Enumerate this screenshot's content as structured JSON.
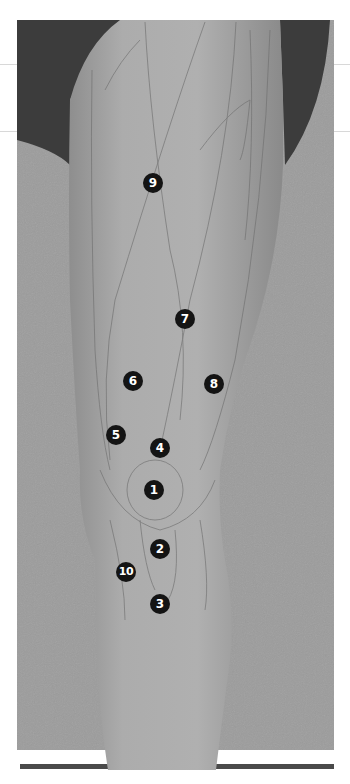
{
  "figure": {
    "type": "anatomical-illustration",
    "colors": {
      "background_frame": "#9a9a9a",
      "shadow": "#3a3a3a",
      "skin": "#a8a8a8",
      "marker": "#141414",
      "marker_text": "#ffffff"
    }
  },
  "points": [
    {
      "label": "1",
      "x": 154,
      "y": 490
    },
    {
      "label": "2",
      "x": 160,
      "y": 549
    },
    {
      "label": "3",
      "x": 160,
      "y": 604
    },
    {
      "label": "4",
      "x": 160,
      "y": 448
    },
    {
      "label": "5",
      "x": 116,
      "y": 435
    },
    {
      "label": "6",
      "x": 133,
      "y": 381
    },
    {
      "label": "7",
      "x": 185,
      "y": 319
    },
    {
      "label": "8",
      "x": 214,
      "y": 384
    },
    {
      "label": "9",
      "x": 153,
      "y": 183
    },
    {
      "label": "10",
      "x": 126,
      "y": 572
    }
  ]
}
